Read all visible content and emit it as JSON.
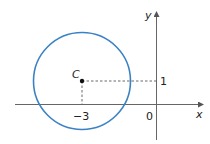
{
  "diagram": {
    "type": "circle-on-coordinate-plane",
    "axes": {
      "x_label": "x",
      "y_label": "y",
      "origin_label": "0"
    },
    "center": {
      "label": "C",
      "x": -3,
      "y": 1
    },
    "ticks": {
      "x_tick_label": "−3",
      "y_tick_label": "1"
    },
    "colors": {
      "circle": "#3b82c4",
      "axes": "#555555",
      "dashed": "#444444"
    }
  }
}
